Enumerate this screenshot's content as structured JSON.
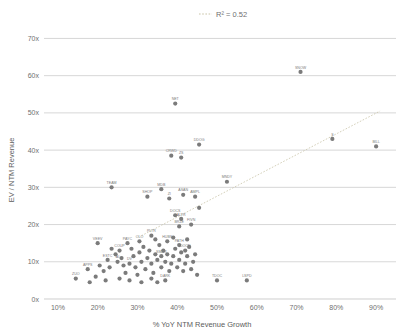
{
  "chart_data": {
    "type": "scatter",
    "title": "R² = 0.52",
    "legend_label": "R² = 0.52",
    "legend_position": "top-center",
    "xlabel": "% YoY NTM Revenue Growth",
    "ylabel": "EV / NTM Revenue",
    "xlim": [
      5,
      95
    ],
    "ylim": [
      0,
      72
    ],
    "xticks": [
      "10%",
      "20%",
      "30%",
      "40%",
      "50%",
      "60%",
      "70%",
      "80%",
      "90%"
    ],
    "xtick_values": [
      10,
      20,
      30,
      40,
      50,
      60,
      70,
      80,
      90
    ],
    "yticks": [
      "0x",
      "10x",
      "20x",
      "30x",
      "40x",
      "50x",
      "60x",
      "70x"
    ],
    "ytick_values": [
      0,
      10,
      20,
      30,
      40,
      50,
      60,
      70
    ],
    "grid": true,
    "r_squared": 0.52,
    "trendline": {
      "x0": 31,
      "y0": 17.0,
      "x1": 91,
      "y1": 50.5,
      "style": "dotted"
    },
    "colors": {
      "point": "#7b7b7b",
      "grid": "#c5c5c5",
      "trendline": "#c9c4a8",
      "text": "#6f6f6f",
      "background": "#ffffff"
    },
    "points": [
      {
        "label": "SNOW",
        "x": 71.0,
        "y": 61.0
      },
      {
        "label": "NET",
        "x": 39.5,
        "y": 52.5
      },
      {
        "label": "S",
        "x": 79.0,
        "y": 43.0
      },
      {
        "label": "BILL",
        "x": 90.0,
        "y": 41.0
      },
      {
        "label": "DDOG",
        "x": 45.5,
        "y": 41.5
      },
      {
        "label": "CRWD",
        "x": 38.5,
        "y": 38.5
      },
      {
        "label": "ZS",
        "x": 41.0,
        "y": 38.0
      },
      {
        "label": "MNDY",
        "x": 52.5,
        "y": 31.5
      },
      {
        "label": "TEAM",
        "x": 23.5,
        "y": 30.0
      },
      {
        "label": "MDB",
        "x": 36.0,
        "y": 29.5
      },
      {
        "label": "ASAN",
        "x": 41.5,
        "y": 28.0
      },
      {
        "label": "SHOP",
        "x": 32.5,
        "y": 27.5
      },
      {
        "label": "ZI",
        "x": 38.0,
        "y": 27.0
      },
      {
        "label": "AMPL",
        "x": 44.5,
        "y": 27.5
      },
      {
        "label": "CRWD2",
        "x": 45.5,
        "y": 24.5
      },
      {
        "label": "DOCS",
        "x": 39.5,
        "y": 22.5
      },
      {
        "label": "ALTR",
        "x": 41.0,
        "y": 21.5
      },
      {
        "label": "FIVN",
        "x": 43.5,
        "y": 20.0
      },
      {
        "label": "BRZE",
        "x": 40.5,
        "y": 19.5
      },
      {
        "label": "VEEV",
        "x": 20.0,
        "y": 15.0
      },
      {
        "label": "PAYC",
        "x": 27.5,
        "y": 15.0
      },
      {
        "label": "OLO",
        "x": 30.5,
        "y": 15.5
      },
      {
        "label": "PLTR",
        "x": 33.5,
        "y": 17.0
      },
      {
        "label": "HUBS",
        "x": 37.5,
        "y": 15.5
      },
      {
        "label": "PATH",
        "x": 40.5,
        "y": 14.5
      },
      {
        "label": "COUP",
        "x": 25.5,
        "y": 13.0
      },
      {
        "label": "DOCN",
        "x": 42.0,
        "y": 13.0
      },
      {
        "label": "SMAR",
        "x": 36.0,
        "y": 11.5
      },
      {
        "label": "ESTC",
        "x": 22.5,
        "y": 10.5
      },
      {
        "label": "AI",
        "x": 25.0,
        "y": 10.0
      },
      {
        "label": "DV",
        "x": 28.0,
        "y": 9.5
      },
      {
        "label": "APPS",
        "x": 17.5,
        "y": 8.0
      },
      {
        "label": "ZUO",
        "x": 14.5,
        "y": 5.5
      },
      {
        "label": "DARK",
        "x": 37.0,
        "y": 5.0
      },
      {
        "label": "TDOC",
        "x": 50.0,
        "y": 5.0
      },
      {
        "label": "LSPD",
        "x": 57.5,
        "y": 5.0
      },
      {
        "label": "",
        "x": 19.5,
        "y": 6.0
      },
      {
        "label": "",
        "x": 21.5,
        "y": 7.5
      },
      {
        "label": "",
        "x": 23.0,
        "y": 8.5
      },
      {
        "label": "",
        "x": 24.5,
        "y": 12.0
      },
      {
        "label": "",
        "x": 26.0,
        "y": 11.0
      },
      {
        "label": "",
        "x": 26.5,
        "y": 9.0
      },
      {
        "label": "",
        "x": 27.0,
        "y": 7.0
      },
      {
        "label": "",
        "x": 28.5,
        "y": 13.5
      },
      {
        "label": "",
        "x": 29.0,
        "y": 11.5
      },
      {
        "label": "",
        "x": 29.5,
        "y": 8.5
      },
      {
        "label": "",
        "x": 30.0,
        "y": 6.5
      },
      {
        "label": "",
        "x": 30.5,
        "y": 12.5
      },
      {
        "label": "",
        "x": 31.0,
        "y": 10.0
      },
      {
        "label": "",
        "x": 31.5,
        "y": 14.0
      },
      {
        "label": "",
        "x": 32.0,
        "y": 8.0
      },
      {
        "label": "",
        "x": 32.5,
        "y": 11.0
      },
      {
        "label": "",
        "x": 33.0,
        "y": 13.0
      },
      {
        "label": "",
        "x": 33.5,
        "y": 9.5
      },
      {
        "label": "",
        "x": 34.0,
        "y": 7.0
      },
      {
        "label": "",
        "x": 34.5,
        "y": 12.0
      },
      {
        "label": "",
        "x": 35.0,
        "y": 10.5
      },
      {
        "label": "",
        "x": 35.5,
        "y": 14.5
      },
      {
        "label": "",
        "x": 36.0,
        "y": 8.5
      },
      {
        "label": "",
        "x": 36.5,
        "y": 13.0
      },
      {
        "label": "",
        "x": 37.0,
        "y": 10.0
      },
      {
        "label": "",
        "x": 37.5,
        "y": 12.0
      },
      {
        "label": "",
        "x": 38.0,
        "y": 7.5
      },
      {
        "label": "",
        "x": 38.5,
        "y": 9.5
      },
      {
        "label": "",
        "x": 39.0,
        "y": 11.5
      },
      {
        "label": "",
        "x": 39.5,
        "y": 13.5
      },
      {
        "label": "",
        "x": 40.0,
        "y": 8.5
      },
      {
        "label": "",
        "x": 40.5,
        "y": 10.5
      },
      {
        "label": "",
        "x": 41.0,
        "y": 12.5
      },
      {
        "label": "",
        "x": 41.5,
        "y": 7.5
      },
      {
        "label": "",
        "x": 42.0,
        "y": 9.5
      },
      {
        "label": "",
        "x": 42.5,
        "y": 11.5
      },
      {
        "label": "",
        "x": 43.0,
        "y": 14.0
      },
      {
        "label": "",
        "x": 43.5,
        "y": 8.0
      },
      {
        "label": "",
        "x": 44.0,
        "y": 10.0
      },
      {
        "label": "",
        "x": 44.5,
        "y": 12.0
      },
      {
        "label": "",
        "x": 45.0,
        "y": 6.5
      },
      {
        "label": "",
        "x": 22.0,
        "y": 5.0
      },
      {
        "label": "",
        "x": 25.5,
        "y": 5.5
      },
      {
        "label": "",
        "x": 28.0,
        "y": 5.0
      },
      {
        "label": "",
        "x": 31.0,
        "y": 4.5
      },
      {
        "label": "",
        "x": 33.5,
        "y": 5.5
      },
      {
        "label": "",
        "x": 35.0,
        "y": 4.5
      },
      {
        "label": "",
        "x": 18.0,
        "y": 4.5
      },
      {
        "label": "",
        "x": 20.5,
        "y": 9.0
      },
      {
        "label": "",
        "x": 23.5,
        "y": 13.5
      },
      {
        "label": "",
        "x": 34.5,
        "y": 16.0
      },
      {
        "label": "",
        "x": 39.0,
        "y": 16.5
      },
      {
        "label": "",
        "x": 42.5,
        "y": 16.0
      }
    ]
  }
}
